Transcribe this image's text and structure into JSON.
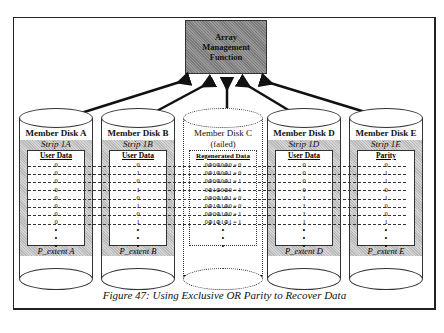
{
  "figure": {
    "caption": "Figure 47: Using Exclusive OR Parity to Recover Data",
    "controller": {
      "label": "Array\nManagement\nFunction"
    }
  },
  "disks": [
    {
      "id": "A",
      "title": "Member Disk A",
      "strip": "Strip 1A",
      "header": "User Data",
      "values": [
        "0",
        "0",
        "0",
        "0",
        "0",
        "0",
        "0",
        "0"
      ],
      "extent": "P_extent A",
      "failed": false,
      "x": 19
    },
    {
      "id": "B",
      "title": "Member Disk B",
      "strip": "Strip 1B",
      "header": "User Data",
      "values": [
        "0",
        "1",
        "0",
        "1",
        "0",
        "1",
        "0",
        "1"
      ],
      "extent": "P_extent B",
      "failed": false,
      "x": 101
    },
    {
      "id": "C",
      "title": "Member Disk C",
      "strip": "(failed)",
      "header": "Regenerated Data",
      "values": [
        "0⊕0⊕0⊕0 = 0",
        "0⊕1⊕0⊕1 = 0",
        "0⊕0⊕0⊕1 = 1",
        "0⊕1⊕0⊕0 = 1",
        "0⊕0⊕1⊕1 = 0",
        "0⊕1⊕1⊕0 = 0",
        "0⊕0⊕1⊕0 = 1",
        "0⊕1⊕1⊕1 = 1"
      ],
      "extent": "",
      "failed": true,
      "x": 183
    },
    {
      "id": "D",
      "title": "Member Disk D",
      "strip": "Strip 1D",
      "header": "User Data",
      "values": [
        "0",
        "0",
        "0",
        "0",
        "1",
        "1",
        "1",
        "1"
      ],
      "extent": "P_extent D",
      "failed": false,
      "x": 267
    },
    {
      "id": "E",
      "title": "Member Disk E",
      "strip": "Strip 1E",
      "header": "Parity",
      "values": [
        "0",
        "1",
        "1",
        "0",
        "1",
        "0",
        "0",
        "1"
      ],
      "extent": "P_extent E",
      "failed": false,
      "x": 349
    }
  ],
  "colors": {
    "shade": "#b8b8b8",
    "controller": "#8a8a8a",
    "line": "#111111"
  }
}
